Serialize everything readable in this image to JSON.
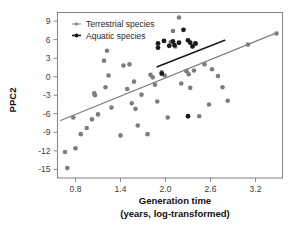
{
  "chart_data": {
    "type": "scatter",
    "title": "",
    "xlabel": "Generation time",
    "xlabel_line2": "(years, log-transformed)",
    "ylabel": "PPC2",
    "xlim": [
      0.56,
      3.56
    ],
    "ylim": [
      -16.4,
      10.4
    ],
    "xticks": [
      "0.8",
      "1.4",
      "2.0",
      "2.6",
      "3.2"
    ],
    "xtick_values": [
      0.8,
      1.4,
      2.0,
      2.6,
      3.2
    ],
    "yticks": [
      "9",
      "6",
      "3",
      "0",
      "-3",
      "-6",
      "-9",
      "-12",
      "-15"
    ],
    "ytick_values": [
      9,
      6,
      3,
      0,
      -3,
      -6,
      -9,
      -12,
      -15
    ],
    "grid": false,
    "legend_position": "top-left",
    "legend": [
      {
        "name": "Terrestrial species",
        "color": "#8c8c8c",
        "marker": "circle"
      },
      {
        "name": "Aquatic species",
        "color": "#1a1a1a",
        "marker": "circle"
      }
    ],
    "series": [
      {
        "name": "Terrestrial species",
        "color": "#7d7d7d",
        "marker_size": 2.3,
        "points": [
          [
            0.66,
            -12.2
          ],
          [
            0.69,
            -14.8
          ],
          [
            0.77,
            -6.6
          ],
          [
            0.8,
            -11.6
          ],
          [
            0.87,
            -9.3
          ],
          [
            0.95,
            -8.3
          ],
          [
            1.02,
            -6.9
          ],
          [
            1.05,
            -2.7
          ],
          [
            1.06,
            -3.0
          ],
          [
            1.1,
            -6.1
          ],
          [
            1.18,
            2.6
          ],
          [
            1.2,
            -1.7
          ],
          [
            1.22,
            4.2
          ],
          [
            1.24,
            0.2
          ],
          [
            1.28,
            -5.0
          ],
          [
            1.4,
            -9.5
          ],
          [
            1.44,
            1.8
          ],
          [
            1.49,
            -2.0
          ],
          [
            1.52,
            2.0
          ],
          [
            1.55,
            -4.3
          ],
          [
            1.58,
            -0.8
          ],
          [
            1.6,
            -5.2
          ],
          [
            1.63,
            -7.9
          ],
          [
            1.68,
            -2.9
          ],
          [
            1.76,
            -9.3
          ],
          [
            1.8,
            0.3
          ],
          [
            1.83,
            -0.1
          ],
          [
            1.86,
            -1.3
          ],
          [
            1.89,
            -4.0
          ],
          [
            1.95,
            0.7
          ],
          [
            1.99,
            0.2
          ],
          [
            2.03,
            -6.6
          ],
          [
            2.07,
            5.6
          ],
          [
            2.1,
            7.4
          ],
          [
            2.13,
            4.9
          ],
          [
            2.18,
            9.6
          ],
          [
            2.21,
            -1.1
          ],
          [
            2.28,
            0.9
          ],
          [
            2.31,
            0.4
          ],
          [
            2.33,
            -1.8
          ],
          [
            2.38,
            1.0
          ],
          [
            2.4,
            5.3
          ],
          [
            2.45,
            -6.4
          ],
          [
            2.52,
            2.0
          ],
          [
            2.58,
            -4.5
          ],
          [
            2.62,
            1.2
          ],
          [
            2.7,
            0.1
          ],
          [
            2.76,
            -1.7
          ],
          [
            2.83,
            -3.9
          ],
          [
            3.1,
            5.2
          ],
          [
            3.48,
            7.0
          ]
        ]
      },
      {
        "name": "Aquatic species",
        "color": "#1a1a1a",
        "marker_size": 2.4,
        "points": [
          [
            1.9,
            5.4
          ],
          [
            1.9,
            4.7
          ],
          [
            1.95,
            0.5
          ],
          [
            1.98,
            5.8
          ],
          [
            2.05,
            5.0
          ],
          [
            2.1,
            5.7
          ],
          [
            2.12,
            5.1
          ],
          [
            2.18,
            5.5
          ],
          [
            2.24,
            7.6
          ],
          [
            2.3,
            5.9
          ],
          [
            2.33,
            5.5
          ],
          [
            2.36,
            4.9
          ],
          [
            2.4,
            5.4
          ],
          [
            2.3,
            -6.4
          ]
        ]
      }
    ],
    "trendlines": [
      {
        "name": "Terrestrial trend",
        "color": "#7d7d7d",
        "width": 1.1,
        "x0": 0.6,
        "y0": -7.1,
        "x1": 3.48,
        "y1": 7.1
      },
      {
        "name": "Aquatic trend",
        "color": "#1a1a1a",
        "width": 1.6,
        "x0": 1.89,
        "y0": 1.6,
        "x1": 2.79,
        "y1": 5.9
      }
    ]
  }
}
